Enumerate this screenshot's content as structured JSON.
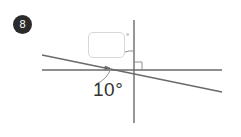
{
  "figure": {
    "badge": {
      "number": "8",
      "background_color": "#2b2b2b",
      "text_color": "#ffffff"
    },
    "answer_box": {
      "value": "",
      "placeholder": "",
      "border_color": "#d7d7d7"
    },
    "degree_marker": {
      "symbol": "°"
    },
    "angle_label": {
      "text": "10°",
      "value": 10,
      "unit": "degrees"
    },
    "line_color": "#555555",
    "lines": [
      {
        "name": "vertical-line",
        "x1": 134,
        "y1": 20,
        "x2": 134,
        "y2": 123
      },
      {
        "name": "horizontal-line",
        "x1": 42,
        "y1": 70,
        "x2": 222,
        "y2": 70
      },
      {
        "name": "transversal-line",
        "x1": 42,
        "y1": 55,
        "x2": 222,
        "y2": 92
      }
    ],
    "markers": [
      {
        "name": "right-angle-marker",
        "type": "square"
      },
      {
        "name": "upper-angle-arc",
        "type": "arc"
      },
      {
        "name": "lower-angle-arc",
        "type": "arc"
      },
      {
        "name": "angle-tick",
        "type": "tick"
      }
    ]
  }
}
